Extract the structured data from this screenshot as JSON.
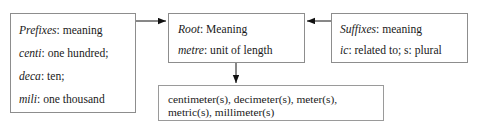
{
  "diagram": {
    "background_color": "#ffffff",
    "border_color": "#8d8d8d",
    "text_color": "#1a1a1a"
  },
  "boxes": {
    "prefixes": {
      "name": "Prefixes",
      "lines": [
        {
          "term": "Prefixes",
          "sep": ": ",
          "gloss": "meaning"
        },
        {
          "term": "centi",
          "sep": ": ",
          "gloss": "one hundred;"
        },
        {
          "term": "deca",
          "sep": ": ",
          "gloss": "ten;"
        },
        {
          "term": "mili",
          "sep": ": ",
          "gloss": "one thousand"
        }
      ]
    },
    "root": {
      "name": "Root",
      "lines": [
        {
          "term": "Root",
          "sep": ": ",
          "gloss": "Meaning"
        },
        {
          "term": "metre",
          "sep": ": ",
          "gloss": "unit of length"
        }
      ]
    },
    "suffixes": {
      "name": "Suffixes",
      "lines": [
        {
          "term": "Suffixes",
          "sep": ": ",
          "gloss": "meaning"
        },
        {
          "term": "ic",
          "sep": ": ",
          "gloss": "related to; s: plural"
        }
      ]
    },
    "derived": {
      "name": "Derived words",
      "lines": [
        {
          "text": "centimeter(s), decimeter(s), meter(s),"
        },
        {
          "text": "metric(s),  millimeter(s)"
        }
      ]
    }
  },
  "connectors": [
    {
      "name": "prefixes-to-root",
      "direction": "right"
    },
    {
      "name": "suffixes-to-root",
      "direction": "left"
    },
    {
      "name": "root-to-derived",
      "direction": "down"
    }
  ]
}
